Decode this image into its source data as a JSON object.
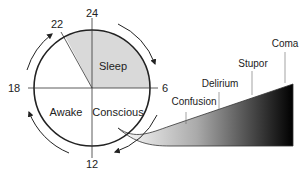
{
  "clock": {
    "hours": {
      "top": "24",
      "right": "6",
      "bottom": "12",
      "left": "18",
      "marker": "22"
    },
    "sectors": {
      "sleep": "Sleep",
      "awake": "Awake",
      "conscious": "Conscious"
    }
  },
  "scale": {
    "levels": [
      "Confusion",
      "Delirium",
      "Stupor",
      "Coma"
    ]
  },
  "colors": {
    "sleep_fill": "#d9d9d9",
    "line": "#222222"
  }
}
